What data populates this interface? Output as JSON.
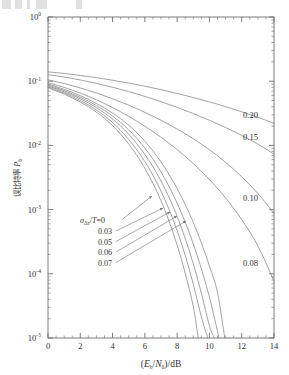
{
  "figure": {
    "background_color": "#ffffff",
    "line_color": "#8a8a8a",
    "axis_color": "#6e6e6e",
    "text_color": "#2f2f2f"
  },
  "chart_data": {
    "type": "line",
    "title": "",
    "xlabel": "(E_b/N_0)/dB",
    "xlabel_parts": {
      "open": "(",
      "E": "E",
      "b": "b",
      "slash1": "/",
      "N": "N",
      "zero": "0",
      "close": ")",
      "slash2": "/",
      "unit": "dB"
    },
    "ylabel": "误比特率 P_b",
    "ylabel_cjk": "误比特率",
    "ylabel_symbol": "P",
    "ylabel_symbol_sub": "b",
    "xlim": [
      0,
      14
    ],
    "ylim": [
      1e-05,
      1
    ],
    "yscale": "log",
    "xscale": "linear",
    "grid": false,
    "legend_position": "inline-annotations",
    "xticks": [
      0,
      2,
      4,
      6,
      8,
      10,
      12,
      14
    ],
    "xticklabels": [
      "0",
      "2",
      "4",
      "6",
      "8",
      "10",
      "12",
      "14"
    ],
    "yticks": [
      1,
      0.1,
      0.01,
      0.001,
      0.0001,
      1e-05
    ],
    "yticklabels": [
      "10^0",
      "10^-1",
      "10^-2",
      "10^-3",
      "10^-4",
      "10^-5"
    ],
    "ytick_mantissa": "10",
    "ytick_exponents": [
      "0",
      "-1",
      "-2",
      "-3",
      "-4",
      "-5"
    ],
    "x_minor_tick_step": 0.5,
    "series_parameter_name": "sigma_dtau/T",
    "series": [
      {
        "name": "0",
        "label": "0",
        "label_kind": "annotation-left",
        "x": [
          0,
          0.5,
          1,
          1.5,
          2,
          2.5,
          3,
          3.5,
          4,
          4.5,
          5,
          5.5,
          6,
          6.5,
          7,
          7.5,
          8,
          8.5,
          9,
          9.3
        ],
        "values": [
          0.0786,
          0.0707,
          0.0629,
          0.0551,
          0.0475,
          0.0401,
          0.033,
          0.0264,
          0.0203,
          0.015,
          0.0105,
          0.007,
          0.00439,
          0.00256,
          0.00137,
          0.000659,
          0.000279,
          0.000102,
          3.11e-05,
          1e-05
        ]
      },
      {
        "name": "0.03",
        "label": "0.03",
        "label_kind": "annotation-left",
        "x": [
          0,
          0.5,
          1,
          1.5,
          2,
          2.5,
          3,
          3.5,
          4,
          4.5,
          5,
          5.5,
          6,
          6.5,
          7,
          7.5,
          8,
          8.5,
          9,
          9.5,
          9.9
        ],
        "values": [
          0.0812,
          0.0733,
          0.0655,
          0.0577,
          0.0501,
          0.0427,
          0.0356,
          0.0289,
          0.0227,
          0.0172,
          0.0124,
          0.00855,
          0.00558,
          0.00342,
          0.00194,
          0.00101,
          0.000471,
          0.000194,
          6.89e-05,
          2.13e-05,
          1e-05
        ]
      },
      {
        "name": "0.05",
        "label": "0.05",
        "label_kind": "annotation-left",
        "x": [
          0,
          0.5,
          1,
          1.5,
          2,
          2.5,
          3,
          3.5,
          4,
          4.5,
          5,
          5.5,
          6,
          6.5,
          7,
          7.5,
          8,
          8.5,
          9,
          9.5,
          10,
          10.3
        ],
        "values": [
          0.0842,
          0.0763,
          0.0685,
          0.0607,
          0.0531,
          0.0458,
          0.0387,
          0.032,
          0.0257,
          0.02,
          0.0149,
          0.0106,
          0.00722,
          0.00464,
          0.00279,
          0.00155,
          0.000786,
          0.000357,
          0.000143,
          4.99e-05,
          1.55e-05,
          1e-05
        ]
      },
      {
        "name": "0.06",
        "label": "0.06",
        "label_kind": "annotation-left",
        "x": [
          0,
          0.5,
          1,
          1.5,
          2,
          2.5,
          3,
          3.5,
          4,
          4.5,
          5,
          5.5,
          6,
          6.5,
          7,
          7.5,
          8,
          8.5,
          9,
          9.5,
          10,
          10.6
        ],
        "values": [
          0.0872,
          0.0793,
          0.0715,
          0.0637,
          0.0561,
          0.0488,
          0.0417,
          0.035,
          0.0286,
          0.0228,
          0.0175,
          0.0129,
          0.00908,
          0.00609,
          0.00386,
          0.00229,
          0.00126,
          0.000638,
          0.000292,
          0.00012,
          4.32e-05,
          1e-05
        ]
      },
      {
        "name": "0.07",
        "label": "0.07",
        "label_kind": "annotation-left",
        "x": [
          0,
          0.5,
          1,
          1.5,
          2,
          2.5,
          3,
          3.5,
          4,
          4.5,
          5,
          5.5,
          6,
          6.5,
          7,
          7.5,
          8,
          8.5,
          9,
          9.5,
          10,
          10.5,
          10.95
        ],
        "values": [
          0.0905,
          0.0826,
          0.0748,
          0.067,
          0.0594,
          0.0521,
          0.045,
          0.0383,
          0.0319,
          0.026,
          0.0206,
          0.0158,
          0.0116,
          0.00819,
          0.00551,
          0.00353,
          0.00213,
          0.0012,
          0.000631,
          0.000303,
          0.000132,
          5.1e-05,
          1e-05
        ]
      },
      {
        "name": "0.08",
        "label": "0.08",
        "label_kind": "annotation-right",
        "x": [
          0,
          1,
          2,
          3,
          4,
          5,
          6,
          7,
          8,
          9,
          10,
          11,
          12,
          13,
          14
        ],
        "values": [
          0.0951,
          0.0801,
          0.0652,
          0.0513,
          0.0389,
          0.0284,
          0.0199,
          0.0134,
          0.0086,
          0.00521,
          0.00294,
          0.00152,
          0.000697,
          0.000272,
          7.7e-05
        ]
      },
      {
        "name": "0.10",
        "label": "0.10",
        "label_kind": "annotation-right",
        "x": [
          0,
          1,
          2,
          3,
          4,
          5,
          6,
          7,
          8,
          9,
          10,
          11,
          12,
          13,
          14
        ],
        "values": [
          0.105,
          0.092,
          0.0785,
          0.0655,
          0.0533,
          0.0423,
          0.0327,
          0.0246,
          0.018,
          0.0127,
          0.00855,
          0.00546,
          0.00325,
          0.00178,
          0.00088
        ]
      },
      {
        "name": "0.15",
        "label": "0.15",
        "label_kind": "annotation-right",
        "x": [
          0,
          1,
          2,
          3,
          4,
          5,
          6,
          7,
          8,
          9,
          10,
          11,
          12,
          13,
          14
        ],
        "values": [
          0.1265,
          0.116,
          0.1045,
          0.0925,
          0.0805,
          0.069,
          0.058,
          0.048,
          0.0391,
          0.0313,
          0.0246,
          0.019,
          0.0143,
          0.0105,
          0.00725
        ]
      },
      {
        "name": "0.20",
        "label": "0.20",
        "label_kind": "annotation-right",
        "x": [
          0,
          1,
          2,
          3,
          4,
          5,
          6,
          7,
          8,
          9,
          10,
          11,
          12,
          13,
          14
        ],
        "values": [
          0.14,
          0.132,
          0.123,
          0.1135,
          0.1035,
          0.0935,
          0.0835,
          0.0738,
          0.0645,
          0.0557,
          0.0476,
          0.0402,
          0.0334,
          0.0274,
          0.0221
        ]
      }
    ],
    "annotations": {
      "parameter_prefix": "σ",
      "parameter_subscript": "Δτ",
      "parameter_mid": "/",
      "parameter_denominator": "T",
      "parameter_equals": "=0",
      "left_labels": [
        "0.03",
        "0.05",
        "0.06",
        "0.07"
      ],
      "right_labels": [
        "0.20",
        "0.15",
        "0.10",
        "0.08"
      ]
    }
  }
}
